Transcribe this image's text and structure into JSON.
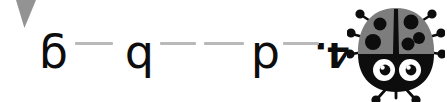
{
  "page": {
    "orientation": "rotated-180",
    "background_color": "#ffffff"
  },
  "colors": {
    "ink": "#0d0d0d",
    "dash": "#b9b9b9",
    "body_gray": "#7d7d7d",
    "wedge_gray": "#8a8a8a",
    "eye_white": "#ffffff"
  },
  "exercise": {
    "item_number": "4.",
    "glyphs": [
      {
        "char": "d",
        "role": "prompt-letter"
      },
      {
        "char": "b",
        "role": "prompt-letter"
      },
      {
        "char": "g",
        "role": "prompt-letter"
      }
    ],
    "dash_count": 4,
    "as_displayed_left_to_right": "6 — q — p — .4"
  },
  "corner": {
    "shape_name": "wedge-fragment",
    "color": "#8a8a8a"
  },
  "ladybug": {
    "name": "ladybug-illustration",
    "body_color": "#7d7d7d",
    "spot_color": "#0d0d0d",
    "head_color": "#0d0d0d",
    "eye_color": "#ffffff",
    "spot_count": 5,
    "antenna_count": 3,
    "leg_count": 5,
    "eye_count": 2
  }
}
